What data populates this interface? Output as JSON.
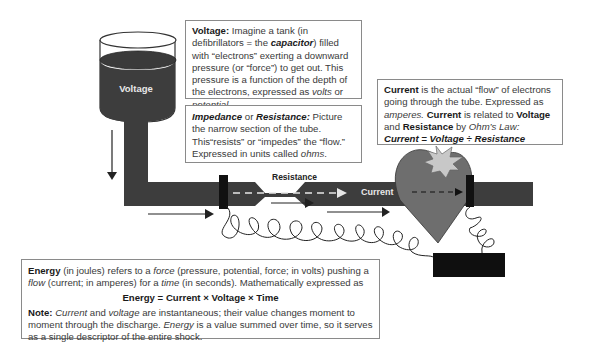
{
  "diagram": {
    "tank_label": "Voltage",
    "resistance_label": "Resistance",
    "current_label": "Current"
  },
  "voltage_box": {
    "title": "Voltage:",
    "text1": " Imagine a tank (in defibrillators = the ",
    "capacitor": "capacitor",
    "text2": ") filled with “electrons” exerting a downward pressure (or “force”) to get out. This pressure is a function of the depth of the electrons, expressed as ",
    "volts": "volts",
    "or": " or ",
    "potential": "potential",
    "end": "."
  },
  "impedance_box": {
    "impedance": "Impedance",
    "or": " or ",
    "resistance": "Resistance:",
    "text1": " Picture the narrow section of the tube. This“resists” or “impedes” the “flow.” Expressed in units called ",
    "ohms": "ohms",
    "end": "."
  },
  "current_box": {
    "current": "Current",
    "text1": " is the actual “flow” of electrons going through the tube. Expressed as ",
    "amperes": "amperes.",
    "current2": " Current",
    "text2": " is related to ",
    "voltage": "Voltage",
    "and": " and ",
    "resistance": "Resistance",
    "by": " by ",
    "ohms_law": "Ohm’s Law:",
    "formula": "Current = Voltage ÷ Resistance"
  },
  "energy_box": {
    "energy": "Energy",
    "text1": " (in joules) refers to a ",
    "force": "force",
    "text2": " (pressure, potential, force; in volts) pushing a ",
    "flow": "flow",
    "text3": " (current; in amperes) for a ",
    "time": "time",
    "text4": " (in seconds). Mathematically expressed as",
    "formula": "Energy = Current × Voltage × Time",
    "note": "Note:",
    "current": "Current",
    "and": " and ",
    "voltage": "voltage",
    "text5": " are instantaneous; their value changes moment to moment through the discharge. ",
    "energy2": "Energy",
    "text6": " is a value summed over time, so it serves as a single descriptor of the entire shock."
  },
  "colors": {
    "tube": "#3d3d3d",
    "heart": "#6e6e6e",
    "spark": "#c8c8c8",
    "electrode": "#111111"
  }
}
